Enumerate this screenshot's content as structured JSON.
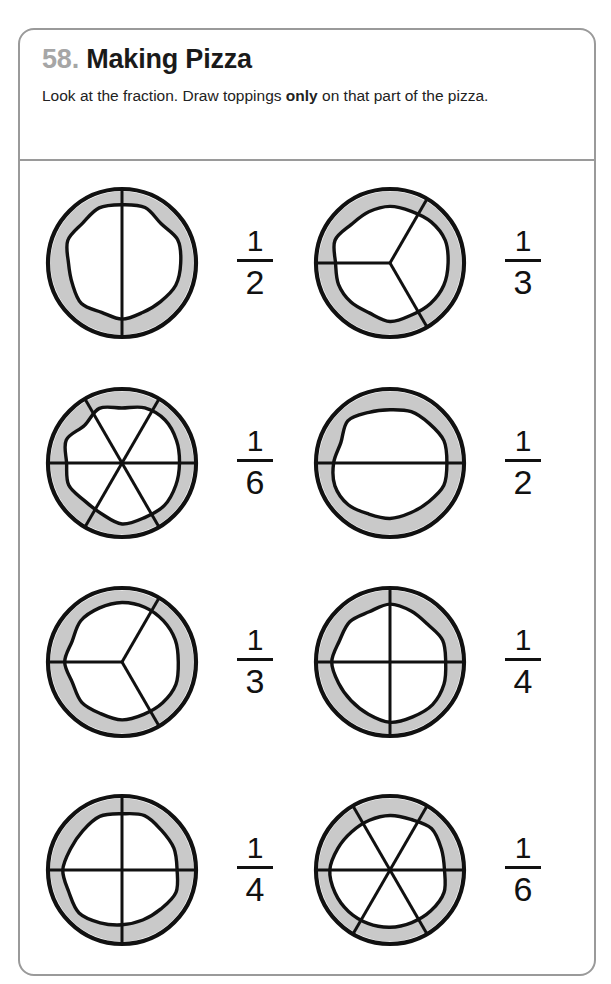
{
  "worksheet": {
    "number": "58.",
    "title": "Making Pizza",
    "instructions_part1": "Look at the fraction. Draw toppings ",
    "instructions_emphasis": "only",
    "instructions_part2": " on that part of the pizza.",
    "instructions_full": "Look at the fraction. Draw toppings only on that part of the pizza.",
    "colors": {
      "frame_border": "#9a9a9a",
      "number_gray": "#a6a6a6",
      "title_black": "#1a1a1a",
      "crust_gray": "#c9c9c9",
      "line_black": "#111111",
      "page_background": "#ffffff"
    }
  },
  "problems": [
    {
      "index": "1",
      "column": "left",
      "row": "1",
      "numerator": "1",
      "denominator": "2",
      "fraction": "1/2",
      "slices": 2,
      "cut_pattern": "vertical-diameter",
      "cut_angles_deg": [
        90,
        270
      ]
    },
    {
      "index": "2",
      "column": "right",
      "row": "1",
      "numerator": "1",
      "denominator": "3",
      "fraction": "1/3",
      "slices": 3,
      "cut_pattern": "three-radii",
      "cut_angles_deg": [
        180,
        60,
        300
      ]
    },
    {
      "index": "3",
      "column": "left",
      "row": "2",
      "numerator": "1",
      "denominator": "6",
      "fraction": "1/6",
      "slices": 6,
      "cut_pattern": "three-diameters",
      "cut_angles_deg": [
        0,
        60,
        120,
        180,
        240,
        300
      ]
    },
    {
      "index": "4",
      "column": "right",
      "row": "2",
      "numerator": "1",
      "denominator": "2",
      "fraction": "1/2",
      "slices": 2,
      "cut_pattern": "horizontal-diameter",
      "cut_angles_deg": [
        0,
        180
      ]
    },
    {
      "index": "5",
      "column": "left",
      "row": "3",
      "numerator": "1",
      "denominator": "3",
      "fraction": "1/3",
      "slices": 3,
      "cut_pattern": "three-radii",
      "cut_angles_deg": [
        180,
        60,
        300
      ]
    },
    {
      "index": "6",
      "column": "right",
      "row": "3",
      "numerator": "1",
      "denominator": "4",
      "fraction": "1/4",
      "slices": 4,
      "cut_pattern": "two-diameters-cross",
      "cut_angles_deg": [
        0,
        90,
        180,
        270
      ]
    },
    {
      "index": "7",
      "column": "left",
      "row": "4",
      "numerator": "1",
      "denominator": "4",
      "fraction": "1/4",
      "slices": 4,
      "cut_pattern": "two-diameters-cross",
      "cut_angles_deg": [
        0,
        90,
        180,
        270
      ]
    },
    {
      "index": "8",
      "column": "right",
      "row": "4",
      "numerator": "1",
      "denominator": "6",
      "fraction": "1/6",
      "slices": 6,
      "cut_pattern": "three-diameters",
      "cut_angles_deg": [
        0,
        60,
        120,
        180,
        240,
        300
      ]
    }
  ]
}
